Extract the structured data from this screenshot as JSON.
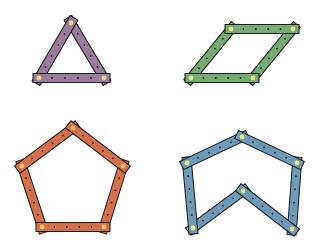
{
  "title": "",
  "bar_width": 9,
  "overhang": 6,
  "stroke": "#1a1a1a",
  "hole_color": "#2a1a1a",
  "shapes": [
    {
      "name": "triangle",
      "fill": "#9a7d9c",
      "pin": "#e8d77a",
      "closed": true,
      "vertices": [
        [
          71,
          23
        ],
        [
          104,
          78
        ],
        [
          39,
          78
        ]
      ],
      "bar_order": [
        0,
        2,
        1
      ],
      "holes_per_bar": 4
    },
    {
      "name": "parallelogram",
      "fill": "#74ac72",
      "pin": "#e7ef7e",
      "closed": true,
      "vertices": [
        [
          231,
          29
        ],
        [
          293,
          29
        ],
        [
          253,
          78
        ],
        [
          191,
          78
        ]
      ],
      "bar_order": [
        1,
        3,
        0,
        2
      ],
      "holes_per_bar": 4
    },
    {
      "name": "pentagon",
      "fill": "#d5704a",
      "pin": "#f2c25a",
      "closed": true,
      "vertices": [
        [
          73,
          128
        ],
        [
          123,
          166
        ],
        [
          104,
          227
        ],
        [
          42,
          227
        ],
        [
          22,
          166
        ]
      ],
      "bar_order": [
        3,
        1,
        4,
        0,
        2
      ],
      "holes_per_bar": 4
    },
    {
      "name": "concave-hexagon",
      "fill": "#6e9ab9",
      "pin": "#e5ef7a",
      "closed": true,
      "vertices": [
        [
          242,
          137
        ],
        [
          297,
          163
        ],
        [
          292,
          229
        ],
        [
          243,
          191
        ],
        [
          193,
          228
        ],
        [
          187,
          163
        ]
      ],
      "bar_order": [
        1,
        3,
        4,
        5,
        0,
        2
      ],
      "holes_per_bar": 4
    }
  ]
}
